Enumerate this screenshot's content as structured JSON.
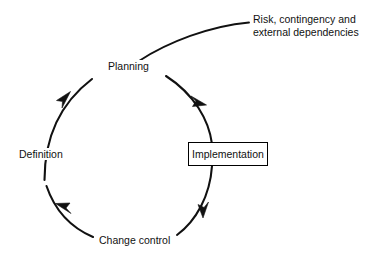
{
  "diagram": {
    "type": "cycle-diagram",
    "background_color": "#ffffff",
    "stroke_color": "#000000",
    "text_color": "#111111",
    "nodes": [
      {
        "id": "planning",
        "label": "Planning",
        "position": "top",
        "style": "plain-text"
      },
      {
        "id": "implementation",
        "label": "Implementation",
        "position": "right",
        "style": "boxed"
      },
      {
        "id": "change-control",
        "label": "Change control",
        "position": "bottom",
        "style": "plain-text"
      },
      {
        "id": "definition",
        "label": "Definition",
        "position": "left",
        "style": "plain-text"
      }
    ],
    "arrows": [
      {
        "from": "planning",
        "to": "implementation",
        "direction": "clockwise",
        "arrowhead": "end"
      },
      {
        "from": "implementation",
        "to": "change-control",
        "direction": "clockwise",
        "arrowhead": "end"
      },
      {
        "from": "change-control",
        "to": "definition",
        "direction": "clockwise",
        "arrowhead": "end"
      },
      {
        "from": "definition",
        "to": "planning",
        "direction": "clockwise",
        "arrowhead": "end"
      }
    ],
    "annotation": {
      "target": "planning",
      "leader": "curved-line",
      "lines": [
        "Risk, contingency and",
        "external dependencies"
      ]
    }
  }
}
